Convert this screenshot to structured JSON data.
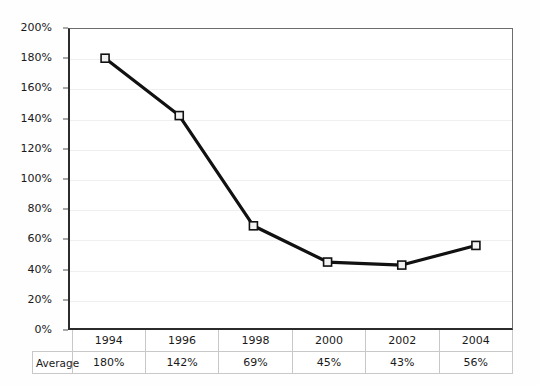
{
  "chart_data": {
    "type": "line",
    "title": "",
    "subtitle": "",
    "xlabel": "",
    "ylabel": "",
    "categories": [
      "1994",
      "1996",
      "1998",
      "2000",
      "2002",
      "2004"
    ],
    "series": [
      {
        "name": "Average",
        "values": [
          180,
          142,
          69,
          45,
          43,
          56
        ],
        "value_labels": [
          "180%",
          "142%",
          "69%",
          "45%",
          "43%",
          "56%"
        ],
        "marker": "square",
        "marker_fill": "#f2f2f2",
        "marker_stroke": "#111111",
        "line_color": "#111111"
      }
    ],
    "ylim": [
      0,
      200
    ],
    "ytick_step": 20,
    "ytick_labels": [
      "0%",
      "20%",
      "40%",
      "60%",
      "80%",
      "100%",
      "120%",
      "140%",
      "160%",
      "180%",
      "200%"
    ],
    "ytick_values": [
      0,
      20,
      40,
      60,
      80,
      100,
      120,
      140,
      160,
      180,
      200
    ],
    "grid": true,
    "grid_color": "#efefef",
    "legend": false,
    "legend_position": "none",
    "axis_color": "#2b2b2b",
    "plot_background": "#ffffff"
  },
  "table": {
    "row_header_label": "Average",
    "categories": [
      "1994",
      "1996",
      "1998",
      "2000",
      "2002",
      "2004"
    ],
    "values": [
      "180%",
      "142%",
      "69%",
      "45%",
      "43%",
      "56%"
    ]
  }
}
